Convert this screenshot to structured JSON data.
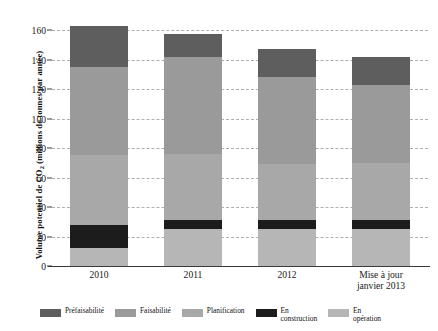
{
  "chart_data": {
    "type": "bar",
    "stacked": true,
    "title": "",
    "xlabel": "",
    "ylabel": "Volume potentiel de CO2 (millions de tonnes par année)",
    "ylabel_parts": {
      "prefix": "Volume potentiel de CO",
      "sub": "2",
      "suffix": " (millions de tonnes par année)"
    },
    "categories": [
      "2010",
      "2011",
      "2012",
      "Mise à jour\njanvier 2013"
    ],
    "category_labels": [
      {
        "line1": "2010",
        "line2": ""
      },
      {
        "line1": "2011",
        "line2": ""
      },
      {
        "line1": "2012",
        "line2": ""
      },
      {
        "line1": "Mise à jour",
        "line2": "janvier 2013"
      }
    ],
    "ylim": [
      0,
      160
    ],
    "yticks": [
      0,
      20,
      40,
      60,
      80,
      100,
      120,
      140,
      160
    ],
    "ytick_labels": [
      "0",
      "20",
      "40",
      "60",
      "80",
      "100",
      "120",
      "140",
      "160"
    ],
    "grid": true,
    "grid_style": "dashed",
    "legend_position": "bottom",
    "stack_order_bottom_to_top": [
      "En opération",
      "En construction",
      "Planification",
      "Faisabilité",
      "Préfaisabilité"
    ],
    "series": [
      {
        "name": "En opération",
        "color": "#b6b6b6",
        "values": [
          12,
          25,
          25,
          25
        ]
      },
      {
        "name": "En construction",
        "color": "#1c1c1c",
        "values": [
          16,
          6,
          6,
          6
        ]
      },
      {
        "name": "Planification",
        "color": "#a8a8a8",
        "values": [
          47,
          45,
          38,
          39
        ]
      },
      {
        "name": "Faisabilité",
        "color": "#9a9a9a",
        "values": [
          60,
          66,
          59,
          53
        ]
      },
      {
        "name": "Préfaisabilité",
        "color": "#5e5e5e",
        "values": [
          28,
          15,
          19,
          19
        ]
      }
    ],
    "totals": [
      163,
      157,
      147,
      142
    ]
  },
  "legend": {
    "items": [
      {
        "label": "Préfaisabilité",
        "color": "#5e5e5e"
      },
      {
        "label": "Faisabilité",
        "color": "#9a9a9a"
      },
      {
        "label": "Planification",
        "color": "#a8a8a8"
      },
      {
        "label": "En\nconstruction",
        "color": "#1c1c1c"
      },
      {
        "label": "En\nopération",
        "color": "#b6b6b6"
      }
    ]
  },
  "colors": {
    "prefaisabilite": "#5e5e5e",
    "faisabilite": "#9a9a9a",
    "planification": "#a8a8a8",
    "en_construction": "#1c1c1c",
    "en_operation": "#b6b6b6",
    "gridline": "#9fa3a6",
    "axis": "#3a3a3a",
    "text": "#1a1a1a",
    "background": "#ffffff"
  }
}
